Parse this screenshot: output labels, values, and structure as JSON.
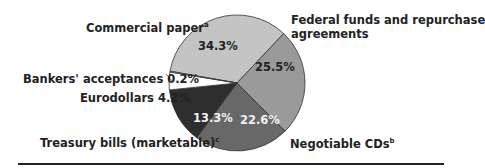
{
  "chart_data": {
    "type": "pie",
    "title": "",
    "slices": [
      {
        "label": "Commercial paper",
        "footnote": "a",
        "value": 34.3,
        "value_label": "34.3%",
        "color": "#c4c4c4"
      },
      {
        "label": "Federal funds and repurchase agreements",
        "footnote": "",
        "value": 25.5,
        "value_label": "25.5%",
        "color": "#9a9a9a"
      },
      {
        "label": "Negotiable CDs",
        "footnote": "b",
        "value": 22.6,
        "value_label": "22.6%",
        "color": "#686868"
      },
      {
        "label": "Treasury bills (marketable)",
        "footnote": "c",
        "value": 13.3,
        "value_label": "13.3%",
        "color": "#2e2e2e"
      },
      {
        "label": "Eurodollars",
        "footnote": "",
        "value": 4.2,
        "value_label": "4.2%",
        "color": "#ffffff"
      },
      {
        "label": "Bankers' acceptances",
        "footnote": "",
        "value": 0.2,
        "value_label": "0.2%",
        "color": "#ffffff"
      }
    ],
    "legend": "none (direct labels)"
  },
  "labels": {
    "commercial_paper": "Commercial paper",
    "commercial_paper_fn": "a",
    "fed_funds_line1": "Federal funds and repurchase",
    "fed_funds_line2": "agreements",
    "negotiable_cds": "Negotiable CDs",
    "negotiable_cds_fn": "b",
    "treasury_bills": "Treasury bills (marketable)",
    "treasury_bills_fn": "c",
    "eurodollars": "Eurodollars 4.2%",
    "bankers": "Bankers' acceptances 0.2%",
    "pct_cp": "34.3%",
    "pct_ff": "25.5%",
    "pct_cd": "22.6%",
    "pct_tb": "13.3%"
  }
}
